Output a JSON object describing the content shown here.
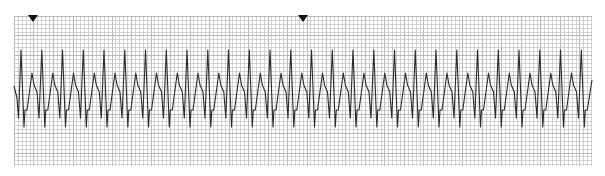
{
  "chart_data": {
    "type": "line",
    "title": "",
    "xlabel": "",
    "ylabel": "",
    "grid": {
      "on": true,
      "left": 14,
      "top": 16,
      "right": 592,
      "bottom": 166,
      "minor_spacing_px": 3.9,
      "major_every": 5,
      "minor_color": "#c9c9c9",
      "major_color": "#a9a9a9"
    },
    "trace_color": "#2b2b2b",
    "markers": [
      {
        "type": "triangle-down",
        "x": 33,
        "y": 16
      },
      {
        "type": "triangle-down",
        "x": 303,
        "y": 16
      }
    ],
    "beats": {
      "count": 28,
      "first_r_peak_x": 21,
      "period_px": 20.75,
      "template_offsets": [
        0,
        3,
        4,
        6,
        11,
        13,
        16,
        18
      ],
      "template_y": [
        50,
        127,
        110,
        110,
        73,
        85,
        92,
        118
      ]
    },
    "trace_start": {
      "x": 14,
      "y": 86
    },
    "trace_end_x": 592
  }
}
